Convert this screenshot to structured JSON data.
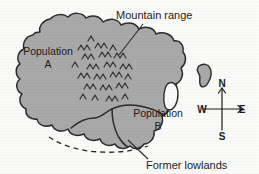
{
  "figure": {
    "type": "map-diagram",
    "background_color": "#fbfbf9",
    "land_fill_color": "#a9a9a9",
    "coastline_color": "#2b2b2b",
    "label_color": "#1c1c1c"
  },
  "labels": {
    "mountain_range": "Mountain range",
    "former_lowlands": "Former lowlands",
    "population_a_name": "Population",
    "population_a_id": "A",
    "population_b_name": "Population",
    "population_b_id": "B"
  },
  "compass": {
    "north": "N",
    "south": "S",
    "west": "W",
    "east": "E"
  },
  "features": {
    "mainland": "large irregular landmass occupying left two-thirds of frame",
    "offshore_island": "small island east of mainland",
    "lagoon": "narrow enclosed white inlet on east coast",
    "mountain_symbols_count": 26,
    "former_lowlands_boundary": "dashed line along southern coast"
  }
}
